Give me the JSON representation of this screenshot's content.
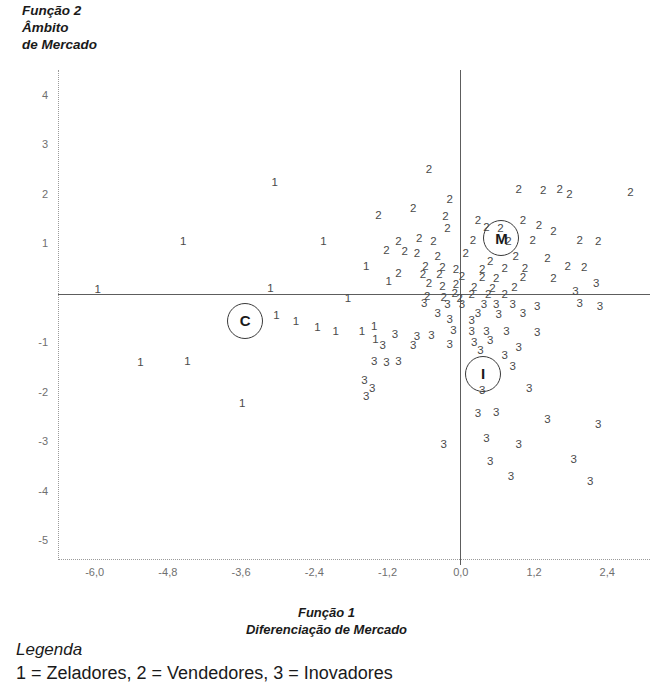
{
  "axes": {
    "y_title": "Função 2\nÂmbito\nde Mercado",
    "x_title": "Função 1\nDiferenciação de Mercado",
    "x_ticks": [
      "-6,0",
      "-4,8",
      "-3,6",
      "-2,4",
      "-1,2",
      "0,0",
      "1,2",
      "2,4"
    ],
    "x_tick_values": [
      -6.0,
      -4.8,
      -3.6,
      -2.4,
      -1.2,
      0.0,
      1.2,
      2.4
    ],
    "y_ticks": [
      "4",
      "3",
      "2",
      "1",
      "-1",
      "-2",
      "-3",
      "-4",
      "-5"
    ],
    "y_tick_values": [
      4,
      3,
      2,
      1,
      -1,
      -2,
      -3,
      -4,
      -5
    ],
    "xlim": [
      -6.6,
      3.1
    ],
    "ylim": [
      -5.4,
      4.5
    ]
  },
  "legend": {
    "title": "Legenda",
    "body": "1 = Zeladores, 2 = Vendedores, 3 = Inovadores"
  },
  "clusters": [
    {
      "label": "C",
      "x": -3.55,
      "y": -0.55
    },
    {
      "label": "M",
      "x": 0.65,
      "y": 1.12
    },
    {
      "label": "I",
      "x": 0.35,
      "y": -1.62
    }
  ],
  "chart_data": {
    "type": "scatter",
    "title": "",
    "xlabel": "Função 1 — Diferenciação de Mercado",
    "ylabel": "Função 2 — Âmbito de Mercado",
    "xlim": [
      -6.6,
      3.1
    ],
    "ylim": [
      -5.4,
      4.5
    ],
    "grid": false,
    "legend_position": "below-plot",
    "series": [
      {
        "name": "1 = Zeladores",
        "marker_label": "1",
        "points": [
          [
            -3.05,
            2.22
          ],
          [
            -4.55,
            1.03
          ],
          [
            -2.25,
            1.02
          ],
          [
            -5.95,
            0.06
          ],
          [
            -3.12,
            0.07
          ],
          [
            -1.55,
            0.52
          ],
          [
            -1.18,
            0.22
          ],
          [
            -1.85,
            -0.12
          ],
          [
            -2.35,
            -0.72
          ],
          [
            -2.05,
            -0.8
          ],
          [
            -1.62,
            -0.8
          ],
          [
            -1.42,
            -0.7
          ],
          [
            -1.4,
            -0.95
          ],
          [
            -2.7,
            -0.6
          ],
          [
            -3.02,
            -0.48
          ],
          [
            -5.25,
            -1.42
          ],
          [
            -4.48,
            -1.4
          ],
          [
            -3.58,
            -2.25
          ]
        ]
      },
      {
        "name": "2 = Vendedores",
        "marker_label": "2",
        "points": [
          [
            -0.52,
            2.48
          ],
          [
            0.95,
            2.08
          ],
          [
            1.35,
            2.05
          ],
          [
            1.62,
            2.08
          ],
          [
            1.78,
            1.98
          ],
          [
            2.78,
            2.02
          ],
          [
            -0.78,
            1.7
          ],
          [
            -0.18,
            1.88
          ],
          [
            -1.35,
            1.55
          ],
          [
            -0.25,
            1.52
          ],
          [
            -0.22,
            1.28
          ],
          [
            0.28,
            1.45
          ],
          [
            1.02,
            1.45
          ],
          [
            0.42,
            1.3
          ],
          [
            0.65,
            1.28
          ],
          [
            1.28,
            1.35
          ],
          [
            1.52,
            1.22
          ],
          [
            -1.02,
            1.02
          ],
          [
            -0.68,
            1.08
          ],
          [
            -0.45,
            1.02
          ],
          [
            0.2,
            1.05
          ],
          [
            0.78,
            1.02
          ],
          [
            1.18,
            1.05
          ],
          [
            1.95,
            1.05
          ],
          [
            2.25,
            1.02
          ],
          [
            -1.22,
            0.85
          ],
          [
            -0.92,
            0.82
          ],
          [
            -0.72,
            0.78
          ],
          [
            -0.38,
            0.72
          ],
          [
            0.08,
            0.78
          ],
          [
            0.48,
            0.62
          ],
          [
            0.9,
            0.72
          ],
          [
            1.42,
            0.68
          ],
          [
            -0.58,
            0.52
          ],
          [
            -0.3,
            0.5
          ],
          [
            -0.08,
            0.45
          ],
          [
            0.35,
            0.45
          ],
          [
            0.72,
            0.48
          ],
          [
            1.05,
            0.48
          ],
          [
            1.75,
            0.52
          ],
          [
            2.02,
            0.5
          ],
          [
            -1.02,
            0.38
          ],
          [
            -0.62,
            0.35
          ],
          [
            -0.35,
            0.35
          ],
          [
            0.02,
            0.32
          ],
          [
            0.35,
            0.3
          ],
          [
            0.58,
            0.28
          ],
          [
            1.02,
            0.3
          ],
          [
            1.52,
            0.28
          ],
          [
            -0.52,
            0.18
          ],
          [
            -0.3,
            0.12
          ],
          [
            -0.08,
            0.15
          ],
          [
            0.22,
            0.1
          ],
          [
            0.52,
            0.08
          ],
          [
            0.88,
            0.1
          ],
          [
            -0.1,
            -0.02
          ],
          [
            0.18,
            -0.05
          ],
          [
            0.45,
            -0.05
          ],
          [
            0.72,
            -0.05
          ],
          [
            -0.55,
            -0.08
          ],
          [
            -0.28,
            -0.1
          ],
          [
            -0.02,
            -0.12
          ]
        ]
      },
      {
        "name": "3 = Inovadores",
        "marker_label": "3",
        "points": [
          [
            2.22,
            0.18
          ],
          [
            1.88,
            0.02
          ],
          [
            -0.6,
            -0.22
          ],
          [
            -0.22,
            -0.25
          ],
          [
            0.02,
            -0.25
          ],
          [
            0.38,
            -0.25
          ],
          [
            0.58,
            -0.25
          ],
          [
            0.85,
            -0.25
          ],
          [
            1.25,
            -0.28
          ],
          [
            1.95,
            -0.22
          ],
          [
            2.28,
            -0.28
          ],
          [
            -0.38,
            -0.42
          ],
          [
            0.28,
            -0.42
          ],
          [
            0.62,
            -0.45
          ],
          [
            1.02,
            -0.42
          ],
          [
            -0.18,
            -0.55
          ],
          [
            0.18,
            -0.58
          ],
          [
            -1.08,
            -0.85
          ],
          [
            -0.72,
            -0.9
          ],
          [
            -0.48,
            -0.88
          ],
          [
            -0.12,
            -0.78
          ],
          [
            0.18,
            -0.8
          ],
          [
            0.42,
            -0.8
          ],
          [
            0.75,
            -0.8
          ],
          [
            1.25,
            -0.82
          ],
          [
            -1.28,
            -1.08
          ],
          [
            -0.78,
            -1.08
          ],
          [
            -0.18,
            -1.05
          ],
          [
            0.22,
            -1.02
          ],
          [
            0.48,
            -0.98
          ],
          [
            0.32,
            -1.18
          ],
          [
            0.95,
            -1.12
          ],
          [
            -1.42,
            -1.4
          ],
          [
            -1.22,
            -1.42
          ],
          [
            -1.02,
            -1.4
          ],
          [
            0.72,
            -1.28
          ],
          [
            0.85,
            -1.5
          ],
          [
            -1.58,
            -1.78
          ],
          [
            -1.45,
            -1.95
          ],
          [
            -1.55,
            -2.1
          ],
          [
            0.35,
            -1.98
          ],
          [
            1.12,
            -1.95
          ],
          [
            0.28,
            -2.45
          ],
          [
            0.58,
            -2.42
          ],
          [
            1.42,
            -2.58
          ],
          [
            2.25,
            -2.68
          ],
          [
            0.95,
            -3.08
          ],
          [
            0.42,
            -2.95
          ],
          [
            0.48,
            -3.42
          ],
          [
            1.85,
            -3.38
          ],
          [
            2.12,
            -3.82
          ],
          [
            0.82,
            -3.72
          ],
          [
            -0.28,
            -3.08
          ]
        ]
      }
    ]
  }
}
